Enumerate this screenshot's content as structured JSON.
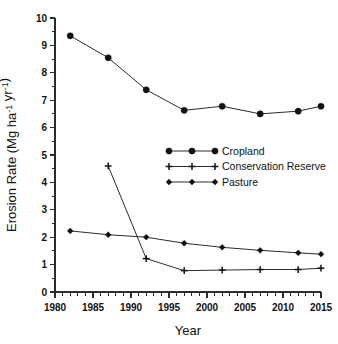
{
  "chart_data": {
    "type": "line",
    "title": "",
    "xlabel": "Year",
    "ylabel": "Erosion Rate (Mg ha⁻¹ yr⁻¹)",
    "xlim": [
      1980,
      2015
    ],
    "ylim": [
      0,
      10
    ],
    "grid": false,
    "legend_position": "center",
    "x_ticks": [
      1980,
      1985,
      1990,
      1995,
      2000,
      2005,
      2010,
      2015
    ],
    "x_tick_labels": [
      "1980",
      "1985",
      "1990",
      "1995",
      "2000",
      "2005",
      "2010",
      "2015"
    ],
    "x_minor_step": 1,
    "y_ticks": [
      0,
      1,
      2,
      3,
      4,
      5,
      6,
      7,
      8,
      9,
      10
    ],
    "y_tick_labels": [
      "0",
      "1",
      "2",
      "3",
      "4",
      "5",
      "6",
      "7",
      "8",
      "9",
      "10"
    ],
    "y_minor_step": 0.5,
    "series": [
      {
        "name": "Cropland",
        "marker": "circle",
        "x": [
          1982,
          1987,
          1992,
          1997,
          2002,
          2007,
          2012,
          2015
        ],
        "values": [
          9.35,
          8.55,
          7.38,
          6.63,
          6.78,
          6.5,
          6.6,
          6.78
        ]
      },
      {
        "name": "Conservation Reserve",
        "marker": "plus",
        "x": [
          1987,
          1992,
          1997,
          2002,
          2007,
          2012,
          2015
        ],
        "values": [
          4.6,
          1.22,
          0.78,
          0.8,
          0.82,
          0.82,
          0.87
        ]
      },
      {
        "name": "Pasture",
        "marker": "diamond",
        "x": [
          1982,
          1987,
          1992,
          1997,
          2002,
          2007,
          2012,
          2015
        ],
        "values": [
          2.23,
          2.09,
          2.0,
          1.78,
          1.63,
          1.52,
          1.43,
          1.38
        ]
      }
    ]
  },
  "legend": {
    "entries": [
      {
        "label": "Cropland",
        "marker": "circle"
      },
      {
        "label": "Conservation Reserve",
        "marker": "plus"
      },
      {
        "label": "Pasture",
        "marker": "diamond"
      }
    ]
  },
  "axes": {
    "x_title": "Year",
    "y_title": "Erosion Rate (Mg ha⁻¹ yr⁻¹)"
  },
  "colors": {
    "line": "#2b2b2b",
    "marker": "#111111",
    "background": "#ffffff"
  }
}
